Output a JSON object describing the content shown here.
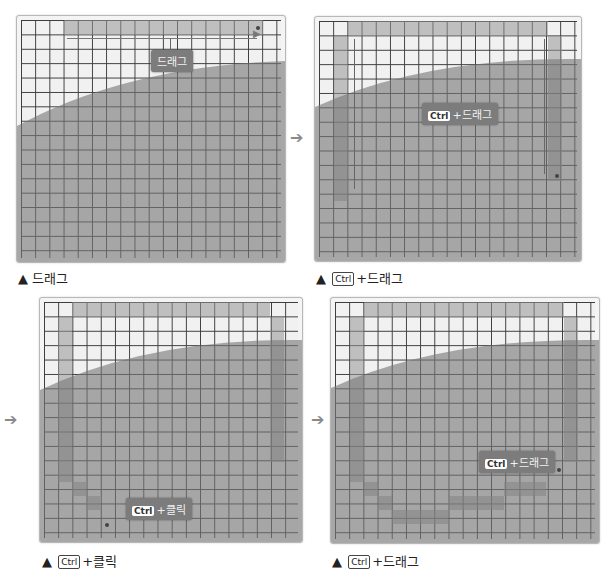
{
  "header_cut": "",
  "panels": [
    {
      "caption_prefix": "▲",
      "caption_key": "",
      "caption_text": "드래그",
      "badge_key": "",
      "badge_text": "드래그"
    },
    {
      "caption_prefix": "▲",
      "caption_key": "Ctrl",
      "caption_text": "+드래그",
      "badge_key": "Ctrl",
      "badge_text": "+드래그"
    },
    {
      "caption_prefix": "▲",
      "caption_key": "Ctrl",
      "caption_text": "+클릭",
      "badge_key": "Ctrl",
      "badge_text": "+클릭"
    },
    {
      "caption_prefix": "▲",
      "caption_key": "Ctrl",
      "caption_text": "+드래그",
      "badge_key": "Ctrl",
      "badge_text": "+드래그"
    }
  ],
  "arrows": {
    "glyph": "➔"
  },
  "colors": {
    "grid_line": "#3a3a3a",
    "highlight": "#969696",
    "overlay": "#8c8c8c",
    "badge": "#7c7c7c"
  }
}
